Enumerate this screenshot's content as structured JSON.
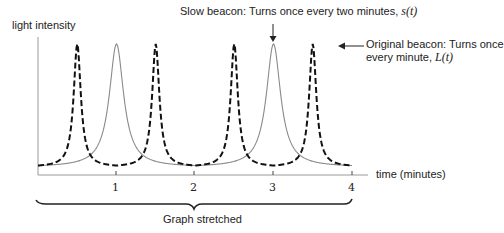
{
  "ylabel": "light intensity",
  "xlabel": "time (minutes)",
  "annotations": {
    "slow": {
      "text": "Slow beacon: Turns once every two minutes, ",
      "math": "s(t)"
    },
    "original": {
      "line1": "Original beacon: Turns once",
      "line2": "every minute, ",
      "math": "L(t)"
    }
  },
  "brace_label": "Graph stretched",
  "ticks": [
    "1",
    "2",
    "3",
    "4"
  ],
  "colors": {
    "slow": "#8a8a8a",
    "original": "#111111",
    "axis": "#999999"
  },
  "chart_data": {
    "type": "line",
    "title": "",
    "xlabel": "time (minutes)",
    "ylabel": "light intensity",
    "xlim": [
      0,
      4
    ],
    "x_ticks": [
      1,
      2,
      3,
      4
    ],
    "series": [
      {
        "name": "Slow beacon s(t)",
        "style": "solid gray",
        "period": 2,
        "peaks_at": [
          1,
          3
        ],
        "troughs_at": [
          0,
          2,
          4
        ]
      },
      {
        "name": "Original beacon L(t)",
        "style": "dashed black",
        "period": 1,
        "peaks_at": [
          0.5,
          1.5,
          2.5,
          3.5
        ],
        "troughs_at": [
          0,
          1,
          2,
          3,
          4
        ]
      }
    ]
  }
}
